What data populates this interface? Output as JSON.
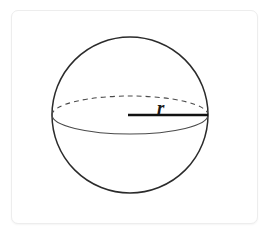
{
  "figure": {
    "kind": "geometry-diagram",
    "background_color": "#ffffff"
  },
  "card": {
    "name": "figure-card",
    "x": 11,
    "y": 10,
    "width": 247,
    "height": 214,
    "corner_radius": 7,
    "fill": "#ffffff",
    "border_color": "#ededed"
  },
  "sphere": {
    "outline": {
      "label": "sphere-outline",
      "center_x": 130,
      "center_y": 115,
      "radius": 78,
      "stroke": "#2b2b2b",
      "stroke_width": 1.5,
      "fill": "none"
    },
    "equator": {
      "label": "equator-ellipse",
      "center_x": 130,
      "center_y": 115,
      "radius_x": 78,
      "radius_y": 19,
      "front_style": "solid",
      "back_style": "dashed",
      "dash_pattern": "5 4",
      "stroke": "#4a4a4a",
      "stroke_width": 1.1,
      "fill": "none"
    }
  },
  "radius": {
    "line_label": "radius-line",
    "from_x": 128,
    "from_y": 115,
    "to_x": 208,
    "to_y": 115,
    "stroke": "#111111",
    "stroke_width": 2.6,
    "label": "r",
    "label_x": 157,
    "label_y": 114,
    "label_color": "#1a1a1a"
  }
}
